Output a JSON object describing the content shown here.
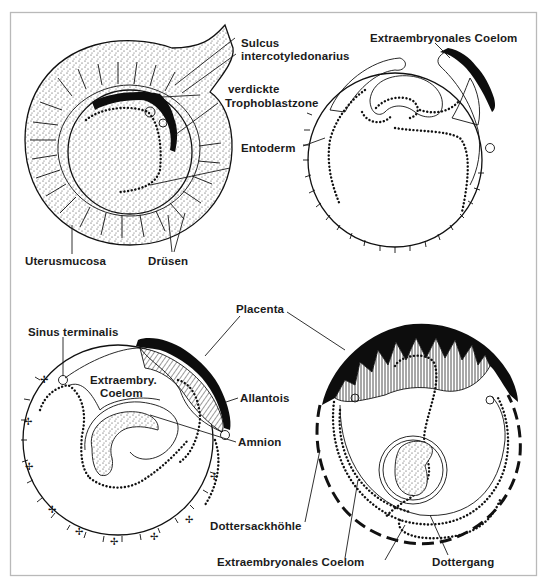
{
  "figure": {
    "panels": [
      {
        "id": "a",
        "position": "top-left",
        "labels": [
          {
            "key": "sulcus_line1",
            "text": "Sulcus"
          },
          {
            "key": "sulcus_line2",
            "text": "intercotyledonarius"
          },
          {
            "key": "troph_line1",
            "text": "verdickte"
          },
          {
            "key": "troph_line2",
            "text": "Trophoblastzone"
          },
          {
            "key": "entoderm",
            "text": "Entoderm"
          },
          {
            "key": "uterusmucosa",
            "text": "Uterusmucosa"
          },
          {
            "key": "druesen",
            "text": "Drüsen"
          }
        ]
      },
      {
        "id": "b",
        "position": "top-right",
        "labels": [
          {
            "key": "coelom",
            "text": "Extraembryonales Coelom"
          }
        ]
      },
      {
        "id": "c",
        "position": "bottom-left",
        "labels": [
          {
            "key": "sinus",
            "text": "Sinus terminalis"
          },
          {
            "key": "placenta",
            "text": "Placenta"
          },
          {
            "key": "coelom_line1",
            "text": "Extraembry."
          },
          {
            "key": "coelom_line2",
            "text": "Coelom"
          },
          {
            "key": "allantois",
            "text": "Allantois"
          },
          {
            "key": "amnion",
            "text": "Amnion"
          }
        ]
      },
      {
        "id": "d",
        "position": "bottom-right",
        "labels": [
          {
            "key": "dottersack",
            "text": "Dottersackhöhle"
          },
          {
            "key": "coelom",
            "text": "Extraembryonales Coelom"
          },
          {
            "key": "dottergang",
            "text": "Dottergang"
          }
        ]
      }
    ]
  },
  "colors": {
    "ink": "#111111",
    "frame": "#b9b9b9",
    "background": "#ffffff"
  }
}
